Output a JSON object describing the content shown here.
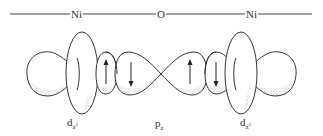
{
  "bond_line": {
    "atoms": [
      {
        "symbol": "Ni",
        "x": 75
      },
      {
        "symbol": "O",
        "x": 161
      },
      {
        "symbol": "Ni",
        "x": 250
      }
    ]
  },
  "orbitals": [
    {
      "name": "d",
      "subscript": "z",
      "superscript": "2",
      "position": "left",
      "spins": [
        "up"
      ]
    },
    {
      "name": "p",
      "subscript": "z",
      "superscript": "",
      "position": "center",
      "spins": [
        "down",
        "up"
      ]
    },
    {
      "name": "d",
      "subscript": "z",
      "superscript": "2",
      "position": "right",
      "spins": [
        "down"
      ]
    }
  ],
  "labels": {
    "left_atom": "Ni",
    "center_atom": "O",
    "right_atom": "Ni",
    "left_orbital_main": "d",
    "left_orbital_sub": "z",
    "left_orbital_sup": "2",
    "center_orbital_main": "p",
    "center_orbital_sub": "z",
    "right_orbital_main": "d",
    "right_orbital_sub": "z",
    "right_orbital_sup": "2"
  },
  "colors": {
    "stroke": "#333333",
    "shading": "#9a9a9a",
    "background": "#ffffff"
  }
}
